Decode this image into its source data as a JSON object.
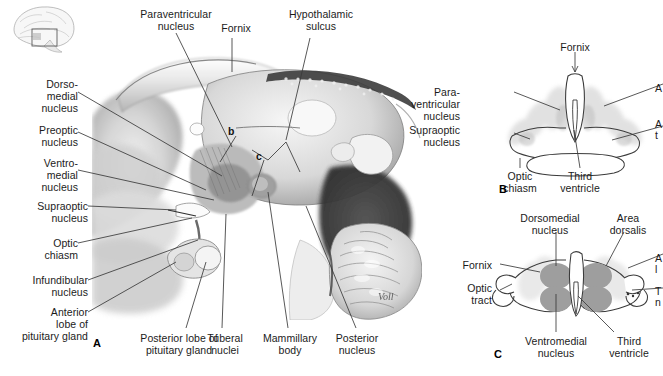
{
  "figure": {
    "inset": {
      "name": "brain-orientation-inset",
      "description": "lateral brain outline with highlight box"
    },
    "signature": "Voll"
  },
  "panels": [
    {
      "id": "A",
      "letter": "A",
      "type": "midsagittal-section",
      "labels_left": [
        {
          "text": "Dorso-\nmedial\nnucleus",
          "x": 16,
          "y": 78
        },
        {
          "text": "Preoptic\nnucleus",
          "x": 16,
          "y": 124
        },
        {
          "text": "Ventro-\nmedial\nnucleus",
          "x": 16,
          "y": 157
        },
        {
          "text": "Supraoptic\nnucleus",
          "x": 4,
          "y": 202
        },
        {
          "text": "Optic\nchiasm",
          "x": 16,
          "y": 236
        },
        {
          "text": "Infundibular\nnucleus",
          "x": 4,
          "y": 272
        },
        {
          "text": "Anterior\nlobe of\npituitary gland",
          "x": 4,
          "y": 305
        }
      ],
      "labels_top": [
        {
          "text": "Paraventricular\nnucleus",
          "x": 120,
          "y": 8
        },
        {
          "text": "Fornix",
          "x": 213,
          "y": 22
        },
        {
          "text": "Hypothalamic\nsulcus",
          "x": 272,
          "y": 8
        }
      ],
      "labels_bottom": [
        {
          "text": "Posterior lobe of\npituitary gland",
          "x": 113,
          "y": 333
        },
        {
          "text": "Tuberal\nnuclei",
          "x": 203,
          "y": 333
        },
        {
          "text": "Mammillary\nbody",
          "x": 257,
          "y": 333
        },
        {
          "text": "Posterior\nnucleus",
          "x": 328,
          "y": 333
        }
      ],
      "section_markers": [
        {
          "text": "b",
          "x": 228,
          "y": 128
        },
        {
          "text": "c",
          "x": 257,
          "y": 152
        }
      ]
    },
    {
      "id": "B",
      "letter": "B",
      "type": "coronal-section-anterior",
      "labels": [
        {
          "text": "Fornix",
          "x": 575,
          "y": 42,
          "align": "c"
        },
        {
          "text": "Para-\nventricular\nnucleus",
          "x": 460,
          "y": 92,
          "align": "r"
        },
        {
          "text": "Supraoptic\nnucleus",
          "x": 460,
          "y": 130,
          "align": "r"
        },
        {
          "text": "Optic\nchiasm",
          "x": 520,
          "y": 172,
          "align": "c"
        },
        {
          "text": "Third\nventricle",
          "x": 580,
          "y": 172,
          "align": "c"
        }
      ],
      "labels_clipped_right": [
        {
          "text": "A",
          "x": 655,
          "y": 88
        },
        {
          "text": "A",
          "x": 655,
          "y": 122
        },
        {
          "text": "t",
          "x": 655,
          "y": 133
        }
      ]
    },
    {
      "id": "C",
      "letter": "C",
      "type": "coronal-section-posterior",
      "labels": [
        {
          "text": "Dorsomedial\nnucleus",
          "x": 543,
          "y": 214,
          "align": "c"
        },
        {
          "text": "Area\ndorsalis",
          "x": 627,
          "y": 214,
          "align": "c"
        },
        {
          "text": "Fornix",
          "x": 492,
          "y": 262,
          "align": "r"
        },
        {
          "text": "Optic\ntract",
          "x": 492,
          "y": 288,
          "align": "r"
        },
        {
          "text": "Ventromedial\nnucleus",
          "x": 556,
          "y": 338,
          "align": "c"
        },
        {
          "text": "Third\nventricle",
          "x": 629,
          "y": 338,
          "align": "c"
        }
      ],
      "labels_clipped_right": [
        {
          "text": "A",
          "x": 655,
          "y": 258
        },
        {
          "text": "l",
          "x": 655,
          "y": 269
        },
        {
          "text": "T",
          "x": 655,
          "y": 290
        },
        {
          "text": "n",
          "x": 655,
          "y": 301
        }
      ]
    }
  ],
  "colors": {
    "text": "#1b1b1b",
    "leader_line": "#3a3a3a",
    "nucleus_fill": "#9b9b9b",
    "nucleus_faint": "#d8d8d8",
    "outline": "#4a4a4a",
    "background": "#ffffff"
  }
}
